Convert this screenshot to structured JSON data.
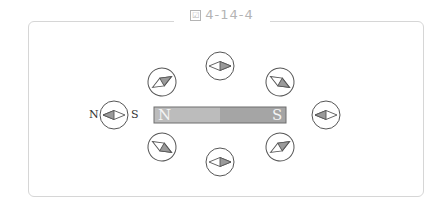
{
  "figure": {
    "title_icon": "figure-icon",
    "title_icon_glyph": "☑",
    "title": "4-14-4"
  },
  "magnet": {
    "north_label": "N",
    "south_label": "S",
    "north_color": "#b8b8b8",
    "south_color": "#a3a3a3"
  },
  "reference_compass": {
    "north_label": "N",
    "south_label": "S"
  },
  "compasses": [
    {
      "position": "left",
      "angle": 180
    },
    {
      "position": "top-left",
      "angle": -30
    },
    {
      "position": "top",
      "angle": 0
    },
    {
      "position": "top-right",
      "angle": 30
    },
    {
      "position": "right",
      "angle": 180
    },
    {
      "position": "bottom-left",
      "angle": 30
    },
    {
      "position": "bottom",
      "angle": 0
    },
    {
      "position": "bottom-right",
      "angle": -30
    }
  ]
}
